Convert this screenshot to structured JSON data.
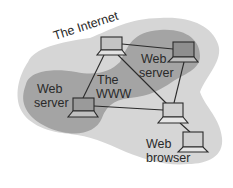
{
  "diagram": {
    "type": "network-diagram",
    "regions": {
      "internet": {
        "label": "The Internet",
        "color": "#d4d4d4"
      },
      "www": {
        "label_line1": "The",
        "label_line2": "WWW",
        "color": "#9e9e9e"
      }
    },
    "nodes": [
      {
        "id": "node-top",
        "label": ""
      },
      {
        "id": "node-right",
        "label_line1": "Web",
        "label_line2": "server"
      },
      {
        "id": "node-left",
        "label_line1": "Web",
        "label_line2": "server"
      },
      {
        "id": "node-center",
        "label": ""
      },
      {
        "id": "node-browser",
        "label_line1": "Web",
        "label_line2": "browser"
      }
    ],
    "edges": [
      [
        "node-top",
        "node-right"
      ],
      [
        "node-top",
        "node-left"
      ],
      [
        "node-top",
        "node-center"
      ],
      [
        "node-right",
        "node-center"
      ],
      [
        "node-left",
        "node-center"
      ],
      [
        "node-center",
        "node-browser"
      ]
    ],
    "colors": {
      "line": "#2a2a2a",
      "laptop_fill": "#bdbdbd",
      "laptop_stroke": "#2a2a2a"
    }
  }
}
